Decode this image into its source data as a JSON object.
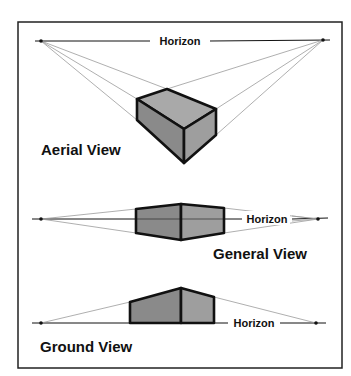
{
  "diagram": {
    "frame": {
      "x": 18,
      "y": 22,
      "w": 324,
      "h": 346
    },
    "colors": {
      "line": "#111111",
      "guide": "#9a9a9a",
      "face_dark": "#8c8c8c",
      "face_light": "#a6a6a6"
    },
    "panels": [
      {
        "title": "Aerial View",
        "horizon_label": "Horizon",
        "horizon_y": 41,
        "vanishing_points": [
          [
            41,
            41
          ],
          [
            323,
            40
          ]
        ]
      },
      {
        "title": "General View",
        "horizon_label": "Horizon",
        "horizon_y": 219,
        "vanishing_points": [
          [
            41,
            219
          ],
          [
            318,
            219
          ]
        ]
      },
      {
        "title": "Ground View",
        "horizon_label": "Horizon",
        "horizon_y": 323,
        "vanishing_points": [
          [
            41,
            323
          ],
          [
            316,
            323
          ]
        ]
      }
    ]
  }
}
